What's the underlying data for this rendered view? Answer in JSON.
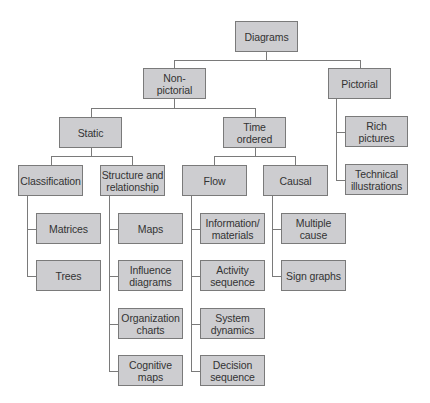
{
  "diagram": {
    "type": "tree",
    "colors": {
      "box_fill": "#cdcdd0",
      "box_border": "#7a7a7a",
      "line": "#7a7a7a",
      "text": "#333333"
    },
    "nodes": {
      "diagrams": "Diagrams",
      "non_pictorial": "Non-\npictorial",
      "pictorial": "Pictorial",
      "rich_pictures": "Rich\npictures",
      "technical_illustrations": "Technical\nillustrations",
      "static": "Static",
      "time_ordered": "Time\nordered",
      "classification": "Classification",
      "structure_relationship": "Structure and\nrelationship",
      "flow": "Flow",
      "causal": "Causal",
      "matrices": "Matrices",
      "trees": "Trees",
      "maps": "Maps",
      "influence_diagrams": "Influence\ndiagrams",
      "organization_charts": "Organization\ncharts",
      "cognitive_maps": "Cognitive\nmaps",
      "information_materials": "Information/\nmaterials",
      "activity_sequence": "Activity\nsequence",
      "system_dynamics": "System\ndynamics",
      "decision_sequence": "Decision\nsequence",
      "multiple_cause": "Multiple\ncause",
      "sign_graphs": "Sign graphs"
    },
    "edges": [
      [
        "Diagrams",
        "Non-pictorial"
      ],
      [
        "Diagrams",
        "Pictorial"
      ],
      [
        "Pictorial",
        "Rich pictures"
      ],
      [
        "Pictorial",
        "Technical illustrations"
      ],
      [
        "Non-pictorial",
        "Static"
      ],
      [
        "Non-pictorial",
        "Time ordered"
      ],
      [
        "Static",
        "Classification"
      ],
      [
        "Static",
        "Structure and relationship"
      ],
      [
        "Time ordered",
        "Flow"
      ],
      [
        "Time ordered",
        "Causal"
      ],
      [
        "Classification",
        "Matrices"
      ],
      [
        "Classification",
        "Trees"
      ],
      [
        "Structure and relationship",
        "Maps"
      ],
      [
        "Structure and relationship",
        "Influence diagrams"
      ],
      [
        "Structure and relationship",
        "Organization charts"
      ],
      [
        "Structure and relationship",
        "Cognitive maps"
      ],
      [
        "Flow",
        "Information/materials"
      ],
      [
        "Flow",
        "Activity sequence"
      ],
      [
        "Flow",
        "System dynamics"
      ],
      [
        "Flow",
        "Decision sequence"
      ],
      [
        "Causal",
        "Multiple cause"
      ],
      [
        "Causal",
        "Sign graphs"
      ]
    ]
  }
}
